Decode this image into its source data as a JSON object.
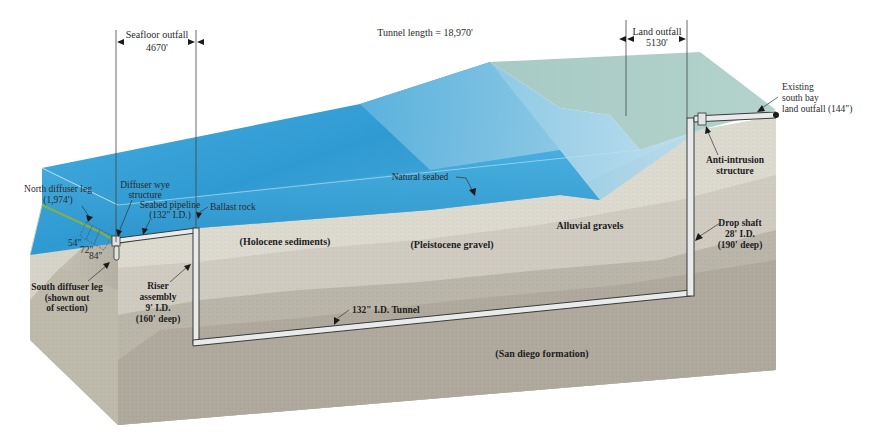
{
  "figure": {
    "colors": {
      "ocean_top": "#3aa7dc",
      "ocean_deep": "#2d93cc",
      "ocean_light": "#8fc6e2",
      "land_surface": "#a9c9c2",
      "sediment_light": "#d9d6cc",
      "sediment_mid": "#c6c2b6",
      "sediment_dark": "#aca79b",
      "block_side": "#b8b4a6",
      "seabed_green": "#7fb04a",
      "pipe": "#e6e9e7"
    }
  },
  "dimensions": {
    "seafloor_outfall": {
      "label": "Seafloor outfall",
      "value": "4670'"
    },
    "tunnel_length": {
      "label": "Tunnel length = 18,970'"
    },
    "land_outfall": {
      "label": "Land outfall",
      "value": "5130'"
    }
  },
  "callouts": {
    "north_diffuser_leg": {
      "line1": "North diffuser leg",
      "line2": "(1,974')"
    },
    "diffuser_wye": {
      "line1": "Diffuser wye",
      "line2": "structure"
    },
    "seabed_pipeline": {
      "line1": "Seabed pipeline",
      "line2": "(132\" I.D.)"
    },
    "ballast_rock": {
      "line1": "Ballast rock"
    },
    "diffuser_sizes": {
      "a": "54\"",
      "b": "72\"",
      "c": "84\""
    },
    "south_diffuser_leg": {
      "line1": "South diffuser leg",
      "line2": "(shown out",
      "line3": "of section)"
    },
    "riser_assembly": {
      "line1": "Riser",
      "line2": "assembly",
      "line3": "9' I.D.",
      "line4": "(160' deep)"
    },
    "natural_seabed": {
      "line1": "Natural seabed"
    },
    "existing_outfall": {
      "line1": "Existing",
      "line2": "south bay",
      "line3": "land outfall (144\")"
    },
    "anti_intrusion": {
      "line1": "Anti-intrusion",
      "line2": "structure"
    },
    "drop_shaft": {
      "line1": "Drop shaft",
      "line2": "28' I.D.",
      "line3": "(190' deep)"
    },
    "tunnel": {
      "line1": "132\" I.D. Tunnel"
    }
  },
  "strata": {
    "holocene": "(Holocene sediments)",
    "pleistocene": "(Pleistocene gravel)",
    "alluvial": "Alluvial gravels",
    "san_diego": "(San diego formation)"
  }
}
